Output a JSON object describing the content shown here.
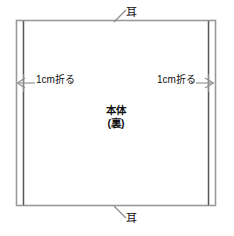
{
  "diagram": {
    "kind": "sewing-pattern",
    "description_type": "line-drawing",
    "colors": {
      "background": "#ffffff",
      "outline": "#9a9a9a",
      "fold_line": "#555555",
      "leader_line": "#8c8c8c",
      "text": "#111111"
    },
    "labels": {
      "selvage_top": "耳",
      "selvage_bottom": "耳",
      "fold_left": "1cm折る",
      "fold_right": "1cm折る",
      "body_main": "本体",
      "body_sub": "(裏)"
    },
    "geometry": {
      "rect_left": 16,
      "rect_top": 20,
      "rect_right": 216,
      "rect_bottom": 206,
      "fold_left_x": 23,
      "fold_right_x": 209
    }
  }
}
